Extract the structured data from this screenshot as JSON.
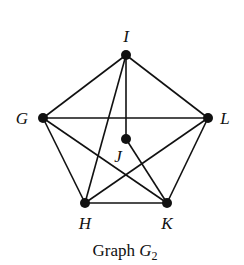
{
  "graph": {
    "name": "G2",
    "caption": {
      "prefix": "Graph ",
      "symbol": "G",
      "subscript": "2"
    },
    "nodes": [
      {
        "id": "I",
        "label": "I",
        "x": 126,
        "y": 55,
        "lx": 126,
        "ly": 42
      },
      {
        "id": "G",
        "label": "G",
        "x": 43,
        "y": 118,
        "lx": 22,
        "ly": 124
      },
      {
        "id": "L",
        "label": "L",
        "x": 208,
        "y": 118,
        "lx": 225,
        "ly": 124
      },
      {
        "id": "J",
        "label": "J",
        "x": 126,
        "y": 139,
        "lx": 118,
        "ly": 162
      },
      {
        "id": "H",
        "label": "H",
        "x": 85,
        "y": 203,
        "lx": 85,
        "ly": 229
      },
      {
        "id": "K",
        "label": "K",
        "x": 167,
        "y": 203,
        "lx": 167,
        "ly": 229
      }
    ],
    "edges": [
      [
        "I",
        "G"
      ],
      [
        "I",
        "L"
      ],
      [
        "I",
        "H"
      ],
      [
        "I",
        "J"
      ],
      [
        "G",
        "L"
      ],
      [
        "G",
        "H"
      ],
      [
        "G",
        "K"
      ],
      [
        "L",
        "H"
      ],
      [
        "L",
        "K"
      ],
      [
        "H",
        "K"
      ],
      [
        "J",
        "K"
      ]
    ]
  }
}
